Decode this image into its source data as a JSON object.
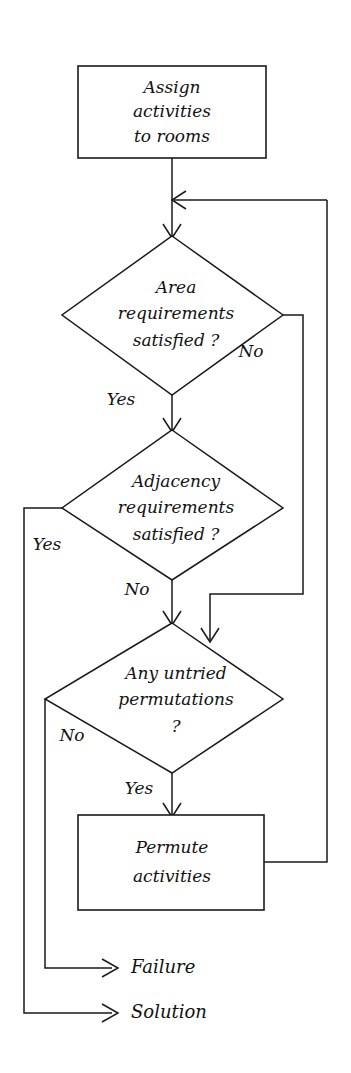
{
  "diagram": {
    "type": "flowchart",
    "orientation": "vertical",
    "background_color": "#ffffff",
    "line_color": "#1a1a1a",
    "text_color": "#111111",
    "nodes": [
      {
        "id": "assign",
        "shape": "process",
        "lines": [
          "Assign",
          "activities",
          "to rooms"
        ]
      },
      {
        "id": "area",
        "shape": "decision",
        "lines": [
          "Area",
          "requirements",
          "satisfied ?"
        ]
      },
      {
        "id": "adjacency",
        "shape": "decision",
        "lines": [
          "Adjacency",
          "requirements",
          "satisfied ?"
        ]
      },
      {
        "id": "permutations",
        "shape": "decision",
        "lines": [
          "Any untried",
          "permutations",
          "?"
        ]
      },
      {
        "id": "permute",
        "shape": "process",
        "lines": [
          "Permute",
          "activities"
        ]
      }
    ],
    "edge_labels": {
      "area_no": "No",
      "area_yes": "Yes",
      "adjacency_yes": "Yes",
      "adjacency_no": "No",
      "permutations_no": "No",
      "permutations_yes": "Yes"
    },
    "terminals": [
      {
        "id": "failure",
        "label": "Failure"
      },
      {
        "id": "solution",
        "label": "Solution"
      }
    ]
  }
}
